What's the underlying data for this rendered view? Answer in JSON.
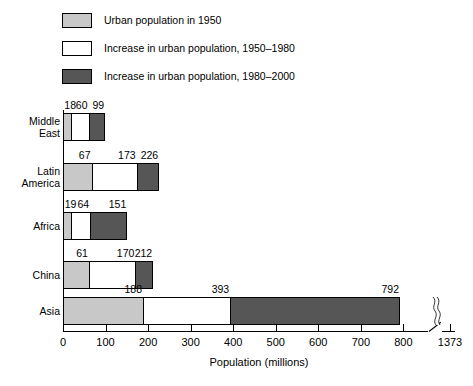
{
  "legend": {
    "items": [
      {
        "label": "Urban population in 1950",
        "swatch": "light-gray",
        "color": "#c8c8c8"
      },
      {
        "label": "Increase in urban population, 1950–1980",
        "swatch": "white",
        "color": "#ffffff"
      },
      {
        "label": "Increase in urban population, 1980–2000",
        "swatch": "dark-gray",
        "color": "#565656"
      }
    ]
  },
  "chart_data": {
    "type": "bar",
    "orientation": "horizontal",
    "title": "",
    "xlabel": "Population (millions)",
    "ylabel": "",
    "xlim": [
      0,
      900
    ],
    "grid": false,
    "legend_position": "top",
    "axis_break": {
      "after": 820,
      "final_tick": 1373
    },
    "xticks": [
      0,
      100,
      200,
      300,
      400,
      500,
      600,
      700,
      800,
      1373
    ],
    "xtick_labels": [
      "0",
      "100",
      "200",
      "300",
      "400",
      "500",
      "600",
      "700",
      "800",
      "1373"
    ],
    "categories": [
      "Middle East",
      "Latin America",
      "Africa",
      "China",
      "Asia"
    ],
    "stacked": true,
    "series": [
      {
        "name": "Urban population in 1950",
        "values": [
          18,
          67,
          19,
          61,
          188
        ]
      },
      {
        "name": "Increase in urban population, 1950–1980",
        "values": [
          42,
          106,
          45,
          109,
          205
        ]
      },
      {
        "name": "Increase in urban population, 1980–2000",
        "values": [
          39,
          53,
          87,
          42,
          581
        ]
      }
    ],
    "cumulative_labels": [
      {
        "category": "Middle East",
        "values": [
          18,
          60,
          99
        ]
      },
      {
        "category": "Latin America",
        "values": [
          67,
          173,
          226
        ]
      },
      {
        "category": "Africa",
        "values": [
          19,
          64,
          151
        ]
      },
      {
        "category": "China",
        "values": [
          61,
          170,
          212
        ]
      },
      {
        "category": "Asia",
        "values": [
          188,
          393,
          792
        ]
      }
    ]
  },
  "rows": [
    {
      "name": "Middle East",
      "label_lines": [
        "Middle",
        "East"
      ],
      "labels": [
        "18",
        "60",
        "99"
      ],
      "ends": [
        18,
        60,
        99
      ]
    },
    {
      "name": "Latin America",
      "label_lines": [
        "Latin",
        "America"
      ],
      "labels": [
        "67",
        "173",
        "226"
      ],
      "ends": [
        67,
        173,
        226
      ]
    },
    {
      "name": "Africa",
      "label_lines": [
        "Africa"
      ],
      "labels": [
        "19",
        "64",
        "151"
      ],
      "ends": [
        19,
        64,
        151
      ]
    },
    {
      "name": "China",
      "label_lines": [
        "China"
      ],
      "labels": [
        "61",
        "170",
        "212"
      ],
      "ends": [
        61,
        170,
        212
      ]
    },
    {
      "name": "Asia",
      "label_lines": [
        "Asia"
      ],
      "labels": [
        "188",
        "393",
        "792"
      ],
      "ends": [
        188,
        393,
        792
      ]
    }
  ],
  "axis": {
    "x_title": "Population (millions)",
    "ticks": [
      "0",
      "100",
      "200",
      "300",
      "400",
      "500",
      "600",
      "700",
      "800",
      "1373"
    ]
  }
}
